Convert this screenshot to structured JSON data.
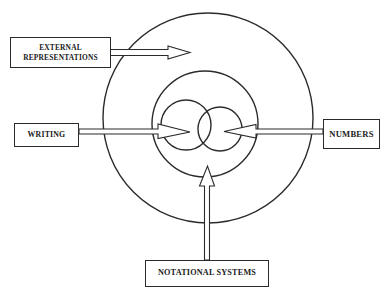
{
  "diagram": {
    "background_color": "#ffffff",
    "stroke_color": "#2b2b2b",
    "boxes": {
      "external": {
        "label": "EXTERNAL\nREPRESENTATIONS",
        "name": "external-representations-box"
      },
      "writing": {
        "label": "WRITING",
        "name": "writing-box"
      },
      "numbers": {
        "label": "NUMBERS",
        "name": "numbers-box"
      },
      "notational": {
        "label": "NOTATIONAL SYSTEMS",
        "name": "notational-systems-box"
      }
    },
    "circles": {
      "outer": {
        "name": "outer-circle",
        "cx": 208,
        "cy": 118,
        "r": 105
      },
      "middle": {
        "name": "middle-circle",
        "cx": 205,
        "cy": 124,
        "r": 53
      },
      "inner_left": {
        "name": "inner-left-circle",
        "cx": 186,
        "cy": 124,
        "r": 25
      },
      "inner_right": {
        "name": "inner-right-circle",
        "cx": 220,
        "cy": 129,
        "r": 22
      }
    },
    "arrows": [
      {
        "name": "arrow-external-to-outer",
        "direction": "right",
        "from": "external-representations-box",
        "to": "outer-circle"
      },
      {
        "name": "arrow-writing-to-inner-left",
        "direction": "right",
        "from": "writing-box",
        "to": "inner-left-circle"
      },
      {
        "name": "arrow-numbers-to-inner-right",
        "direction": "left",
        "from": "numbers-box",
        "to": "inner-right-circle"
      },
      {
        "name": "arrow-notational-to-middle",
        "direction": "up",
        "from": "notational-systems-box",
        "to": "middle-circle"
      }
    ]
  }
}
